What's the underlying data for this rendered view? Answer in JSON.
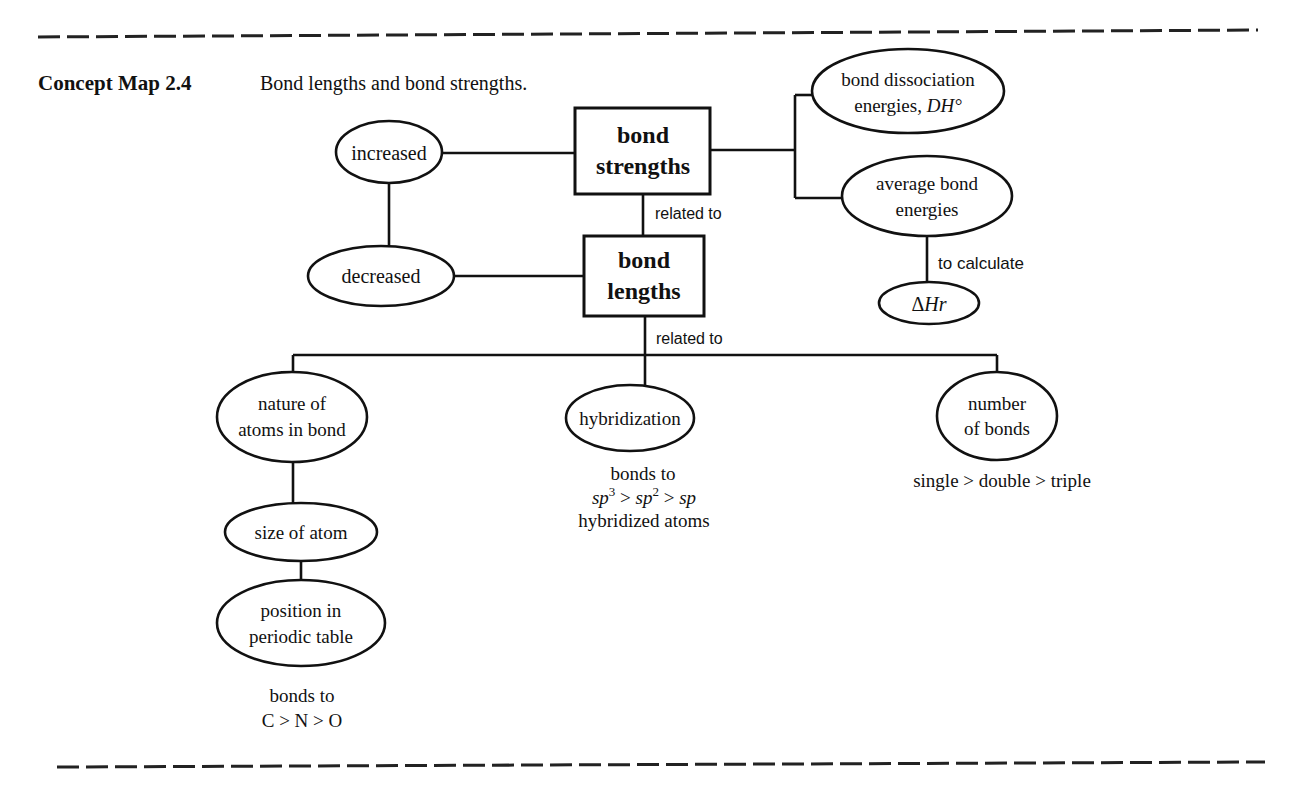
{
  "header": {
    "label": "Concept Map 2.4",
    "caption": "Bond lengths and bond strengths."
  },
  "nodes": {
    "bond_strengths": {
      "line1": "bond",
      "line2": "strengths"
    },
    "bond_lengths": {
      "line1": "bond",
      "line2": "lengths"
    },
    "increased": {
      "label": "increased"
    },
    "decreased": {
      "label": "decreased"
    },
    "bond_dissociation": {
      "line1": "bond dissociation",
      "line2": "energies, ",
      "line2_italic": "DH°"
    },
    "average_bond": {
      "line1": "average bond",
      "line2": "energies"
    },
    "delta_hr": {
      "delta": "Δ",
      "label": "Hr"
    },
    "nature_of_atoms": {
      "line1": "nature of",
      "line2": "atoms in bond"
    },
    "hybridization": {
      "label": "hybridization"
    },
    "number_of_bonds": {
      "line1": "number",
      "line2": "of bonds"
    },
    "size_of_atom": {
      "label": "size of atom"
    },
    "position_periodic": {
      "line1": "position in",
      "line2": "periodic table"
    }
  },
  "edge_labels": {
    "strengths_to_lengths": "related to",
    "lengths_to_factors": "related to",
    "average_to_delta": "to calculate"
  },
  "annotations": {
    "hybridization_note": {
      "line1": "bonds to",
      "sp3": "sp",
      "sp3_sup": "3",
      "gt1": " > ",
      "sp2": "sp",
      "sp2_sup": "2",
      "gt2": " > ",
      "sp": "sp",
      "line3": "hybridized atoms"
    },
    "number_note": "single > double > triple",
    "periodic_note": {
      "line1": "bonds to",
      "line2": "C > N > O"
    }
  }
}
